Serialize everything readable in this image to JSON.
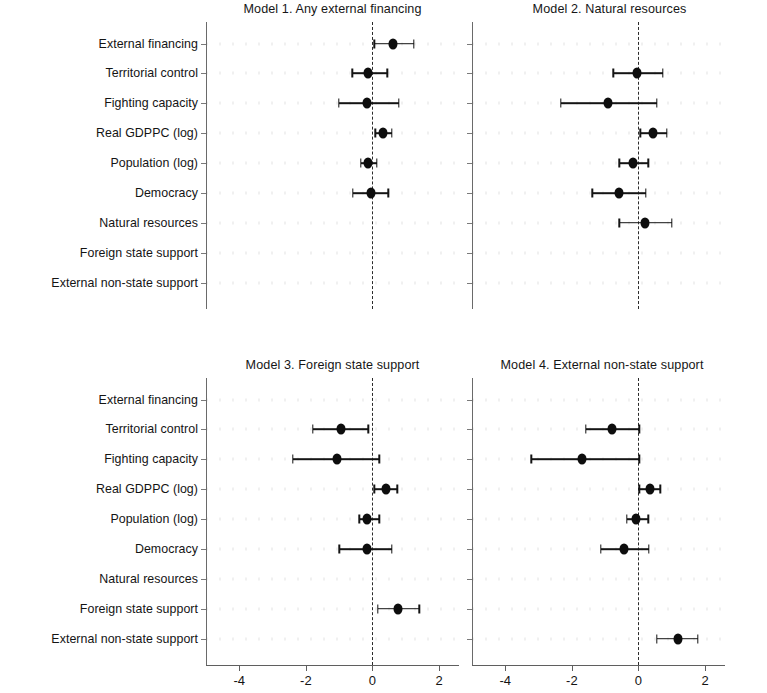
{
  "figure": {
    "background": "#ffffff",
    "marker_color": "#0d0d0d",
    "zero_line_color": "#2b2b2b",
    "axis_color": "#5f5f5f"
  },
  "row_labels": [
    "External financing",
    "Territorial control",
    "Fighting capacity",
    "Real GDPPC (log)",
    "Population (log)",
    "Democracy",
    "Natural resources",
    "Foreign state support",
    "External non-state support"
  ],
  "axis": {
    "ticks": [
      -4,
      -2,
      0,
      2
    ],
    "tick_labels": [
      "-4",
      "-2",
      "0",
      "2"
    ],
    "xlim": [
      -5,
      2.6
    ],
    "zero_reference": 0
  },
  "chart_data": {
    "type": "scatter",
    "title": "",
    "xlabel": "",
    "ylabel": "",
    "grid": false,
    "legend": "none",
    "layout": "2x2 small multiples of coefficient (forest) plots",
    "categories": [
      "External financing",
      "Territorial control",
      "Fighting capacity",
      "Real GDPPC (log)",
      "Population (log)",
      "Democracy",
      "Natural resources",
      "Foreign state support",
      "External non-state support"
    ],
    "xlim": [
      -5,
      2.6
    ],
    "xticks": [
      -4,
      -2,
      0,
      2
    ],
    "panels": [
      {
        "id": "model-1",
        "title": "Model 1. Any external financing",
        "position": "top-left",
        "points": [
          {
            "label": "External financing",
            "estimate": 0.61,
            "ci_low": 0.05,
            "ci_high": 1.25
          },
          {
            "label": "Territorial control",
            "estimate": -0.13,
            "ci_low": -0.61,
            "ci_high": 0.45
          },
          {
            "label": "Fighting capacity",
            "estimate": -0.16,
            "ci_low": -1.01,
            "ci_high": 0.8
          },
          {
            "label": "Real GDPPC (log)",
            "estimate": 0.32,
            "ci_low": 0.08,
            "ci_high": 0.59
          },
          {
            "label": "Population (log)",
            "estimate": -0.13,
            "ci_low": -0.35,
            "ci_high": 0.13
          },
          {
            "label": "Democracy",
            "estimate": -0.03,
            "ci_low": -0.59,
            "ci_high": 0.48
          },
          {
            "label": "Natural resources",
            "estimate": null,
            "ci_low": null,
            "ci_high": null
          },
          {
            "label": "Foreign state support",
            "estimate": null,
            "ci_low": null,
            "ci_high": null
          },
          {
            "label": "External non-state support",
            "estimate": null,
            "ci_low": null,
            "ci_high": null
          }
        ]
      },
      {
        "id": "model-2",
        "title": "Model 2. Natural resources",
        "position": "top-right",
        "points": [
          {
            "label": "External financing",
            "estimate": null,
            "ci_low": null,
            "ci_high": null
          },
          {
            "label": "Territorial control",
            "estimate": -0.03,
            "ci_low": -0.76,
            "ci_high": 0.74
          },
          {
            "label": "Fighting capacity",
            "estimate": -0.91,
            "ci_low": -2.34,
            "ci_high": 0.55
          },
          {
            "label": "Real GDPPC (log)",
            "estimate": 0.45,
            "ci_low": 0.05,
            "ci_high": 0.86
          },
          {
            "label": "Population (log)",
            "estimate": -0.15,
            "ci_low": -0.58,
            "ci_high": 0.3
          },
          {
            "label": "Democracy",
            "estimate": -0.58,
            "ci_low": -1.39,
            "ci_high": 0.23
          },
          {
            "label": "Natural resources",
            "estimate": 0.2,
            "ci_low": -0.58,
            "ci_high": 1.01
          },
          {
            "label": "Foreign state support",
            "estimate": null,
            "ci_low": null,
            "ci_high": null
          },
          {
            "label": "External non-state support",
            "estimate": null,
            "ci_low": null,
            "ci_high": null
          }
        ]
      },
      {
        "id": "model-3",
        "title": "Model 3. Foreign state support",
        "position": "bottom-left",
        "points": [
          {
            "label": "External financing",
            "estimate": null,
            "ci_low": null,
            "ci_high": null
          },
          {
            "label": "Territorial control",
            "estimate": -0.93,
            "ci_low": -1.79,
            "ci_high": -0.13
          },
          {
            "label": "Fighting capacity",
            "estimate": -1.07,
            "ci_low": -2.4,
            "ci_high": 0.21
          },
          {
            "label": "Real GDPPC (log)",
            "estimate": 0.4,
            "ci_low": 0.05,
            "ci_high": 0.75
          },
          {
            "label": "Population (log)",
            "estimate": -0.17,
            "ci_low": -0.4,
            "ci_high": 0.21
          },
          {
            "label": "Democracy",
            "estimate": -0.17,
            "ci_low": -0.99,
            "ci_high": 0.59
          },
          {
            "label": "Natural resources",
            "estimate": null,
            "ci_low": null,
            "ci_high": null
          },
          {
            "label": "Foreign state support",
            "estimate": 0.77,
            "ci_low": 0.16,
            "ci_high": 1.41
          },
          {
            "label": "External non-state support",
            "estimate": null,
            "ci_low": null,
            "ci_high": null
          }
        ]
      },
      {
        "id": "model-4",
        "title": "Model 4. External non-state support",
        "position": "bottom-right",
        "points": [
          {
            "label": "External financing",
            "estimate": null,
            "ci_low": null,
            "ci_high": null
          },
          {
            "label": "Territorial control",
            "estimate": -0.8,
            "ci_low": -1.58,
            "ci_high": 0.02
          },
          {
            "label": "Fighting capacity",
            "estimate": -1.7,
            "ci_low": -3.22,
            "ci_high": 0.03
          },
          {
            "label": "Real GDPPC (log)",
            "estimate": 0.35,
            "ci_low": 0.03,
            "ci_high": 0.66
          },
          {
            "label": "Population (log)",
            "estimate": -0.08,
            "ci_low": -0.35,
            "ci_high": 0.3
          },
          {
            "label": "Democracy",
            "estimate": -0.44,
            "ci_low": -1.13,
            "ci_high": 0.31
          },
          {
            "label": "Natural resources",
            "estimate": null,
            "ci_low": null,
            "ci_high": null
          },
          {
            "label": "Foreign state support",
            "estimate": null,
            "ci_low": null,
            "ci_high": null
          },
          {
            "label": "External non-state support",
            "estimate": 1.18,
            "ci_low": 0.56,
            "ci_high": 1.78
          }
        ]
      }
    ]
  }
}
